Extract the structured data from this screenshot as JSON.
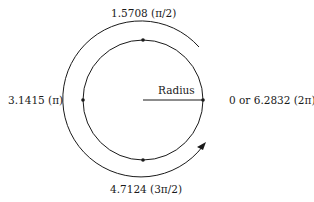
{
  "diagram": {
    "center": {
      "x": 143,
      "y": 100
    },
    "circle_radius": 60,
    "arc_radius": 78,
    "stroke_color": "#1a1a1a",
    "radius_label": "Radius",
    "angle_labels": {
      "right": "0 or 6.2832 (2π)",
      "top": "1.5708 (π/2)",
      "left": "3.1415 (π)",
      "bottom": "4.7124 (3π/2)"
    },
    "arrow_direction": "counterclockwise",
    "arrow_icon": "curved-arrow-icon"
  }
}
